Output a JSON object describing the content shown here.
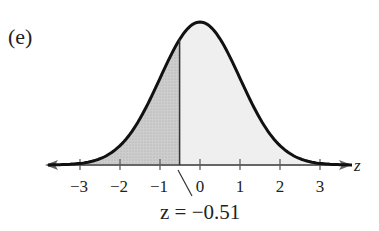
{
  "panel_label": "(e)",
  "annotation": "z = −0.51",
  "axis_label": "z",
  "tick_labels": [
    "−3",
    "−2",
    "−1",
    "0",
    "1",
    "2",
    "3"
  ],
  "colors": {
    "curve": "#111111",
    "shaded_left": "#c8c8c8",
    "shaded_right": "#eeeeee",
    "axis": "#555555"
  },
  "chart_data": {
    "type": "area",
    "title": "(e)",
    "xlabel": "z",
    "ylabel": "",
    "distribution": "standard normal",
    "xlim": [
      -3.8,
      3.8
    ],
    "xticks": [
      -3,
      -2,
      -1,
      0,
      1,
      2,
      3
    ],
    "marker": {
      "z": -0.51,
      "label": "z = −0.51"
    },
    "regions": [
      {
        "name": "left of z",
        "from": -3.8,
        "to": -0.51,
        "shade": "dark"
      },
      {
        "name": "right of z",
        "from": -0.51,
        "to": 3.8,
        "shade": "light"
      }
    ],
    "grid": false,
    "legend": "none"
  }
}
